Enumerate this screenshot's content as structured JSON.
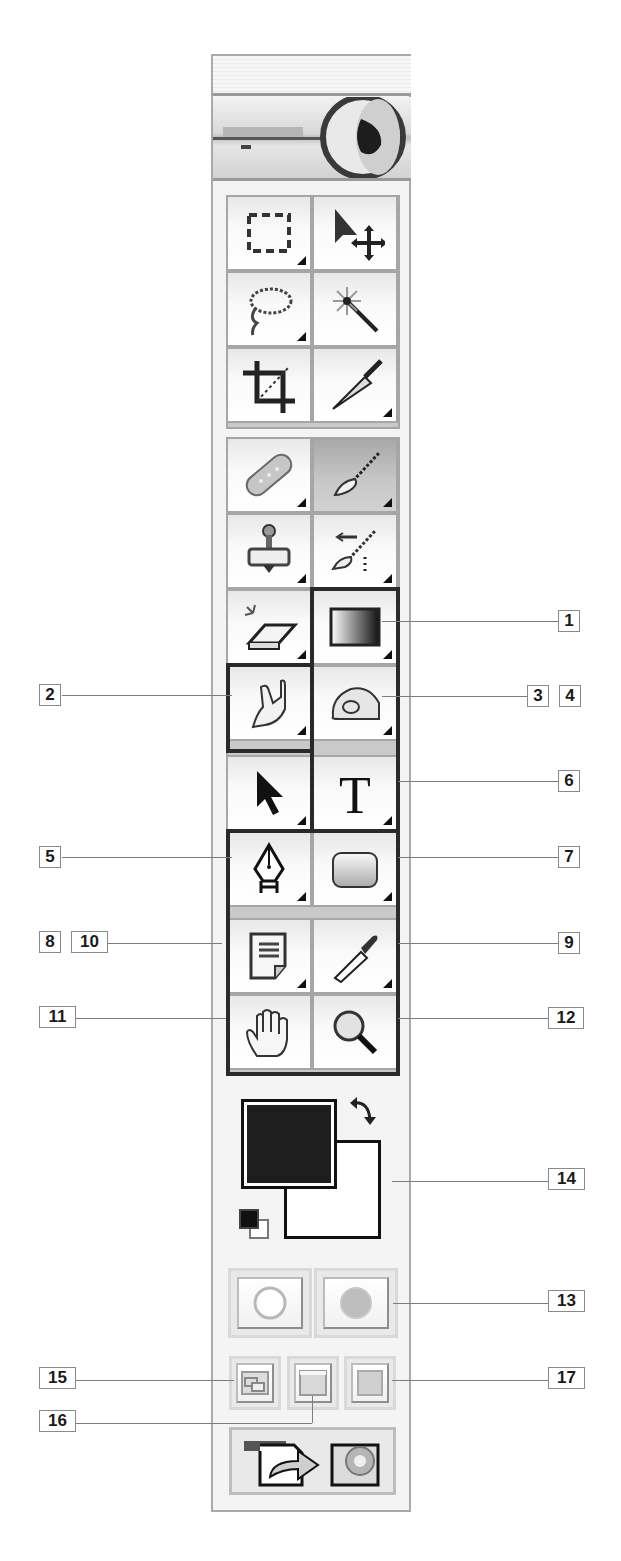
{
  "toolbox": {
    "header": {
      "label": ""
    },
    "logo": {
      "icon": "eye-logo-icon"
    },
    "group1": [
      {
        "name": "rectangular-marquee-tool",
        "icon": "marquee-icon",
        "flyout": true
      },
      {
        "name": "move-tool",
        "icon": "move-icon",
        "flyout": false
      },
      {
        "name": "lasso-tool",
        "icon": "lasso-icon",
        "flyout": true
      },
      {
        "name": "magic-wand-tool",
        "icon": "magic-wand-icon",
        "flyout": false
      },
      {
        "name": "crop-tool",
        "icon": "crop-icon",
        "flyout": false
      },
      {
        "name": "slice-tool",
        "icon": "slice-knife-icon",
        "flyout": true
      }
    ],
    "group2": [
      {
        "name": "healing-brush-tool",
        "icon": "bandage-icon",
        "flyout": true
      },
      {
        "name": "brush-tool",
        "icon": "brush-icon",
        "flyout": true,
        "active": true
      },
      {
        "name": "clone-stamp-tool",
        "icon": "stamp-icon",
        "flyout": true
      },
      {
        "name": "history-brush-tool",
        "icon": "history-brush-icon",
        "flyout": true
      },
      {
        "name": "eraser-tool",
        "icon": "eraser-icon",
        "flyout": true
      },
      {
        "name": "gradient-tool",
        "icon": "gradient-icon",
        "flyout": true
      },
      {
        "name": "smudge-tool",
        "icon": "smudge-finger-icon",
        "flyout": true
      },
      {
        "name": "dodge-tool",
        "icon": "dodge-sponge-icon",
        "flyout": true
      },
      {
        "name": "path-selection-tool",
        "icon": "arrow-cursor-icon",
        "flyout": true
      },
      {
        "name": "type-tool",
        "icon": "type-t-icon",
        "flyout": true
      },
      {
        "name": "pen-tool",
        "icon": "pen-nib-icon",
        "flyout": true
      },
      {
        "name": "shape-tool",
        "icon": "rounded-rect-icon",
        "flyout": true
      },
      {
        "name": "notes-tool",
        "icon": "note-icon",
        "flyout": true
      },
      {
        "name": "eyedropper-tool",
        "icon": "eyedropper-icon",
        "flyout": true
      },
      {
        "name": "hand-tool",
        "icon": "hand-icon",
        "flyout": false
      },
      {
        "name": "zoom-tool",
        "icon": "magnifier-icon",
        "flyout": false
      }
    ],
    "colors": {
      "foreground": "#1e1e1e",
      "background": "#ffffff",
      "swap_icon": "swap-arrows-icon",
      "default_icon": "default-colors-icon"
    },
    "mask_modes": [
      {
        "name": "standard-mode-button",
        "icon": "empty-circle-icon"
      },
      {
        "name": "quick-mask-mode-button",
        "icon": "filled-circle-icon"
      }
    ],
    "screen_modes": [
      {
        "name": "standard-screen-mode-button",
        "icon": "windows-icon"
      },
      {
        "name": "full-screen-menu-mode-button",
        "icon": "window-menubar-icon"
      },
      {
        "name": "full-screen-mode-button",
        "icon": "plain-square-icon"
      }
    ],
    "jump_to": {
      "name": "jump-to-imageready-button",
      "icon": "jump-arrow-icon"
    }
  },
  "callouts": [
    {
      "id": "1",
      "label": "1"
    },
    {
      "id": "2",
      "label": "2"
    },
    {
      "id": "3",
      "label": "3"
    },
    {
      "id": "4",
      "label": "4"
    },
    {
      "id": "5",
      "label": "5"
    },
    {
      "id": "6",
      "label": "6"
    },
    {
      "id": "7",
      "label": "7"
    },
    {
      "id": "8",
      "label": "8"
    },
    {
      "id": "9",
      "label": "9"
    },
    {
      "id": "10",
      "label": "10"
    },
    {
      "id": "11",
      "label": "11"
    },
    {
      "id": "12",
      "label": "12"
    },
    {
      "id": "13",
      "label": "13"
    },
    {
      "id": "14",
      "label": "14"
    },
    {
      "id": "15",
      "label": "15"
    },
    {
      "id": "16",
      "label": "16"
    },
    {
      "id": "17",
      "label": "17"
    }
  ]
}
